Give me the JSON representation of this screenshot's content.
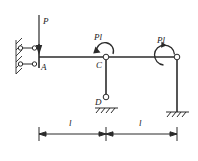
{
  "figure": {
    "type": "structural-frame-diagram",
    "stroke_color": "#2b2b2b",
    "label_color": "#1a1a1a",
    "background": "#ffffff"
  },
  "labels": {
    "load_P": "P",
    "moment_C": "Pl",
    "moment_right": "Pl",
    "joint_A": "A",
    "joint_C": "C",
    "joint_D": "D",
    "span_left": "l",
    "span_right": "l"
  },
  "geometry": {
    "beam": {
      "x_start": 39,
      "x_end": 177,
      "y": 57
    },
    "joints": {
      "A": {
        "x": 39,
        "y": 57
      },
      "C": {
        "x": 106,
        "y": 57
      },
      "D": {
        "x": 106,
        "y": 99
      },
      "right_top": {
        "x": 177,
        "y": 57
      },
      "right_base": {
        "x": 177,
        "y": 112
      }
    },
    "load": {
      "name": "P",
      "x": 39,
      "y_tail": 15,
      "y_head": 52,
      "direction": "down"
    },
    "moments": [
      {
        "name": "Pl",
        "at": "C",
        "sense": "counterclockwise"
      },
      {
        "name": "Pl",
        "at": "right_top",
        "sense": "counterclockwise"
      }
    ],
    "supports": [
      {
        "type": "double-link-to-wall",
        "at": "A"
      },
      {
        "type": "hinge",
        "at": "C"
      },
      {
        "type": "pin-on-ground",
        "at": "D"
      },
      {
        "type": "pin-on-ground",
        "at": "right_base"
      }
    ],
    "dimension_line": {
      "y": 134,
      "ticks": [
        39,
        106,
        177
      ]
    }
  }
}
